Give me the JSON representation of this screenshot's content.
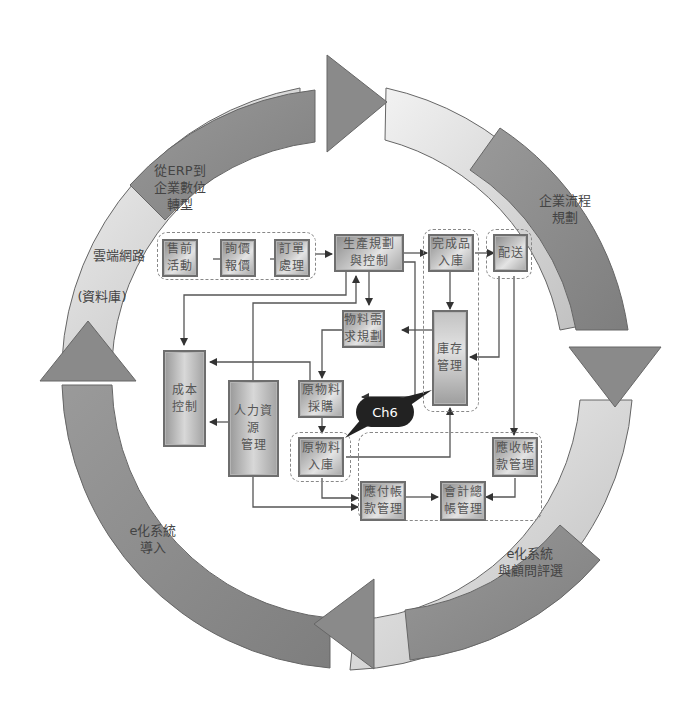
{
  "diagram": {
    "type": "ERP process cycle diagram",
    "ring_labels": {
      "top_left": "從ERP到\n企業數位\n轉型",
      "left_upper": "雲端網路",
      "left_middle": "(資料庫)",
      "right_upper": "企業流程\n規劃",
      "bottom_right": "e化系統\n與顧問評選",
      "bottom_left": "e化系統\n導入"
    },
    "callout": "Ch6",
    "nodes": {
      "presales": "售前\n活動",
      "quotation": "詢價\n報價",
      "order": "訂單\n處理",
      "production": "生產規劃\n與控制",
      "finished_goods": "完成品\n入庫",
      "delivery": "配送",
      "mrp": "物料需\n求規劃",
      "inventory": "庫存\n管理",
      "cost_control": "成本\n控制",
      "hr": "人力資源\n管理",
      "purchasing": "原物料\n採購",
      "raw_receiving": "原物料\n入庫",
      "accounts_receivable": "應收帳\n款管理",
      "accounts_payable": "應付帳\n款管理",
      "general_ledger": "會計總\n帳管理"
    },
    "colors": {
      "ring_dark": "#8a8a8a",
      "ring_light": "#d8d8d8",
      "box_border": "#6e6e6e",
      "line": "#555555",
      "callout_bg": "#222222"
    }
  }
}
